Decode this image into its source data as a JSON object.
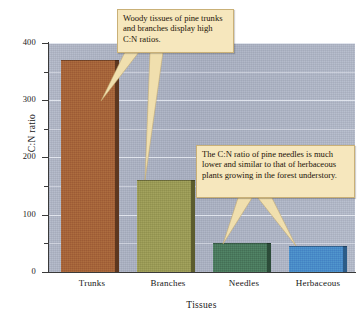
{
  "chart_data": {
    "type": "bar",
    "title": "",
    "categories": [
      "Trunks",
      "Branches",
      "Needles",
      "Herbaceous"
    ],
    "values": [
      370,
      160,
      50,
      45
    ],
    "xlabel": "Tissues",
    "ylabel": "C:N ratio",
    "ylim": [
      0,
      400
    ],
    "ytick_labels": [
      "0",
      "100",
      "200",
      "300",
      "400"
    ],
    "ytick_values": [
      0,
      100,
      200,
      300,
      400
    ],
    "yminor_ticks": [
      50,
      150,
      250,
      350
    ],
    "grid": "horizontal",
    "legend": "none",
    "bar_colors": [
      "#a5643a",
      "#9a9a56",
      "#4b7a5e",
      "#4a8cc8"
    ],
    "bar_edge_colors": [
      "#5d3720",
      "#5c5c2e",
      "#2c4c39",
      "#2c5c88"
    ],
    "plot_background": "#aeb5c6",
    "gridline_color": "#e9ecf3",
    "annotations": [
      {
        "id": "callout-1",
        "text": "Woody tissues of pine trunks and branches display high C:N ratios.",
        "points_to": [
          "Trunks",
          "Branches"
        ]
      },
      {
        "id": "callout-2",
        "text": "The C:N ratio of pine needles is much lower and similar to that of herbaceous plants growing in the forest understory.",
        "points_to": [
          "Needles",
          "Herbaceous"
        ]
      }
    ]
  },
  "axes": {
    "y_title": "C:N ratio",
    "x_title": "Tissues",
    "y_labels": [
      "400",
      "300",
      "200",
      "100",
      "0"
    ],
    "x_labels": [
      "Trunks",
      "Branches",
      "Needles",
      "Herbaceous"
    ]
  },
  "callouts": {
    "one": "Woody tissues of pine trunks and branches display high C:N ratios.",
    "two": "The C:N ratio of pine needles is much lower and similar to that of herbaceous plants growing in the forest understory."
  }
}
